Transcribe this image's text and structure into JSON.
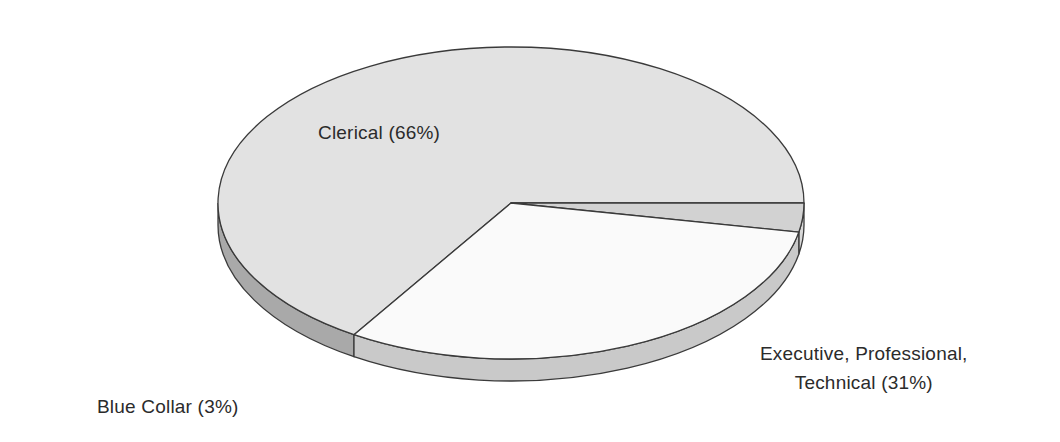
{
  "chart_data": {
    "type": "pie",
    "title": "",
    "xlabel": "",
    "ylabel": "",
    "legend_position": "none",
    "grid": false,
    "three_d": true,
    "categories": [
      "Clerical",
      "Executive, Professional, Technical",
      "Blue Collar"
    ],
    "values": [
      66,
      31,
      3
    ],
    "units": "%",
    "labels": [
      "Clerical (66%)",
      "Executive, Professional, Technical (31%)",
      "Blue Collar (3%)"
    ],
    "slices": [
      {
        "name": "Clerical",
        "value": 66,
        "display_label": "Clerical (66%)",
        "top_color": "#e2e2e2",
        "side_color": "#a9a9a9"
      },
      {
        "name": "Executive, Professional, Technical",
        "value": 31,
        "display_label_line1": "Executive, Professional,",
        "display_label_line2": "Technical (31%)",
        "top_color": "#fafafa",
        "side_color": "#c9c9c9"
      },
      {
        "name": "Blue Collar",
        "value": 3,
        "display_label": "Blue Collar (3%)",
        "top_color": "#d2d2d2",
        "side_color": "#d8d8d8"
      }
    ]
  },
  "chart": {
    "background_color": "#ffffff",
    "outline_color": "#3a3a3a",
    "label_text_color": "#2b2b2b",
    "labels": {
      "clerical": "Clerical (66%)",
      "executive_line1": "Executive, Professional,",
      "executive_line2": "Technical (31%)",
      "blue_collar": "Blue Collar (3%)"
    }
  }
}
